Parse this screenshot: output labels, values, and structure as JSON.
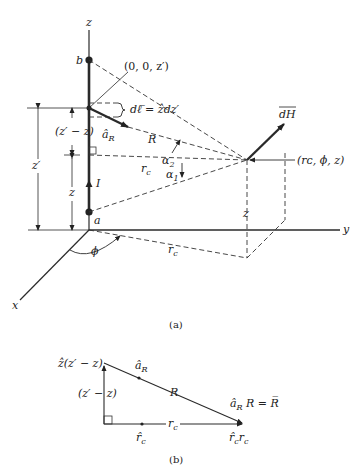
{
  "figure_a": {
    "caption": "(a)",
    "axes": {
      "x": "x",
      "y": "y",
      "z": "z"
    },
    "points": {
      "top": "b",
      "bottom": "a",
      "source": "(0, 0, z′)",
      "field": "(rᴄ, ϕ, z)"
    },
    "labels": {
      "dl": "dℓ̅ = ẑdz′",
      "aR": "â",
      "aR_sub": "R",
      "R": "R",
      "rc_main": "r",
      "rc_sub": "c",
      "rc_floor": "r",
      "alpha2": "α",
      "alpha2_sub": "2",
      "alpha1": "α",
      "alpha1_sub": "1",
      "dH": "dH",
      "current": "I",
      "phi": "ϕ",
      "z_prime_minus_z": "(z′ − z)",
      "z_prime": "z′",
      "z": "z",
      "z_drop": "z"
    }
  },
  "figure_b": {
    "caption": "(b)",
    "labels": {
      "z_vec": "ẑ(z′ − z)",
      "aR": "â",
      "aR_sub": "R",
      "R": "R",
      "vertical": "(z′ − z)",
      "rc": "r",
      "rc_sub": "c",
      "rc_hat": "r̂",
      "rc_hat_sub": "c",
      "R_vec": "â",
      "R_vec_sub": "R",
      "R_vec_rest": " R = R̅",
      "rc_vec": "r̂",
      "rc_vec_sub": "c",
      "rc_vec_rest": "r",
      "rc_vec_rest_sub": "c"
    }
  }
}
